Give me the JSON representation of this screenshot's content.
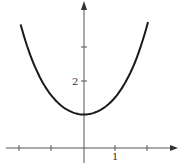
{
  "chart_data": {
    "type": "line",
    "title": "",
    "xlabel": "",
    "ylabel": "",
    "function": "y = cosh(x)",
    "series": [
      {
        "name": "y = cosh x",
        "x": [
          -2,
          -1.5,
          -1,
          -0.5,
          0,
          0.5,
          1,
          1.5,
          2
        ],
        "values": [
          3.76,
          2.35,
          1.54,
          1.13,
          1.0,
          1.13,
          1.54,
          2.35,
          3.76
        ]
      }
    ],
    "xlim": [
      -2.4,
      2.9
    ],
    "ylim": [
      -0.5,
      4.4
    ],
    "x_ticks": [
      -2,
      -1,
      0,
      1,
      2
    ],
    "y_ticks": [
      1,
      2,
      3
    ],
    "tick_labels": {
      "x": [
        "1"
      ],
      "y": [
        "2"
      ]
    },
    "grid": false,
    "legend": "none"
  },
  "labels": {
    "x_one": "1",
    "y_two": "2"
  },
  "colors": {
    "curve": "#1a1a1a",
    "axes": "#555555"
  }
}
